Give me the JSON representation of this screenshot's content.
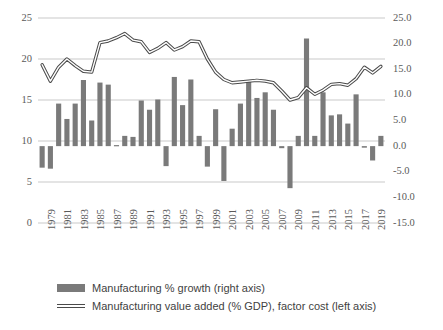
{
  "chart_data": {
    "type": "bar",
    "title": "",
    "subtitle": "",
    "xlabel": "",
    "ylabel": "",
    "grid": true,
    "legend_position": "bottom",
    "x": [
      1979,
      1980,
      1981,
      1982,
      1983,
      1984,
      1985,
      1986,
      1987,
      1988,
      1989,
      1990,
      1991,
      1992,
      1993,
      1994,
      1995,
      1996,
      1997,
      1998,
      1999,
      2000,
      2001,
      2002,
      2003,
      2004,
      2005,
      2006,
      2007,
      2008,
      2009,
      2010,
      2011,
      2012,
      2013,
      2014,
      2015,
      2016,
      2017,
      2018,
      2019,
      2020
    ],
    "xtick_labels": [
      "1979",
      "1981",
      "1983",
      "1985",
      "1987",
      "1989",
      "1991",
      "1993",
      "1995",
      "1997",
      "1999",
      "2001",
      "2003",
      "2005",
      "2007",
      "2009",
      "2011",
      "2013",
      "2015",
      "2017",
      "2019"
    ],
    "left_axis": {
      "label": "Manufacturing value added (% GDP), factor cost",
      "ticks": [
        "0",
        "5",
        "10",
        "15",
        "20",
        "25"
      ],
      "tick_values": [
        0,
        5,
        10,
        15,
        20,
        25
      ],
      "ylim": [
        0,
        25
      ]
    },
    "right_axis": {
      "label": "Manufacturing % growth",
      "ticks": [
        "-15.0",
        "-10.0",
        "-5.0",
        "0.0",
        "5.0",
        "10.0",
        "15.0",
        "20.0",
        "25.0"
      ],
      "tick_values": [
        -15,
        -10,
        -5,
        0,
        5,
        10,
        15,
        20,
        25
      ],
      "ylim": [
        -15,
        25
      ]
    },
    "series": [
      {
        "name": "Manufacturing % growth (right axis)",
        "type": "bar",
        "axis": "right",
        "color": "#7a7a7a",
        "values": [
          -4.2,
          -4.4,
          8.3,
          5.3,
          8.3,
          12.9,
          5.0,
          12.4,
          12.0,
          0.2,
          2.0,
          1.8,
          8.9,
          7.1,
          9.1,
          -3.9,
          13.5,
          8.0,
          13.0,
          2.0,
          -4.0,
          7.2,
          -6.8,
          3.4,
          8.3,
          12.8,
          9.4,
          10.5,
          7.1,
          -0.4,
          -8.2,
          2.0,
          21.0,
          2.0,
          10.5,
          6.0,
          6.2,
          4.4,
          10.1,
          -0.3,
          -2.8,
          2.0
        ]
      },
      {
        "name": "Manufacturing value added (% GDP), factor cost (left axis)",
        "type": "line",
        "axis": "left",
        "color": "#4a4a4a",
        "values": [
          19.3,
          17.3,
          19.0,
          20.0,
          19.2,
          18.5,
          18.4,
          22.0,
          22.2,
          22.6,
          23.1,
          22.3,
          22.1,
          20.8,
          21.3,
          22.0,
          21.1,
          21.5,
          22.2,
          22.1,
          20.0,
          18.4,
          17.5,
          17.1,
          17.2,
          17.3,
          17.4,
          17.3,
          17.1,
          16.1,
          15.0,
          15.3,
          16.5,
          15.7,
          16.2,
          16.9,
          17.0,
          16.8,
          17.6,
          19.0,
          18.3,
          19.1
        ]
      }
    ]
  },
  "legend": {
    "items": [
      {
        "label": "Manufacturing % growth (right axis)",
        "marker": "bar",
        "color": "#7a7a7a"
      },
      {
        "label": "Manufacturing value added (% GDP), factor cost (left axis)",
        "marker": "line",
        "color": "#4a4a4a"
      }
    ]
  }
}
